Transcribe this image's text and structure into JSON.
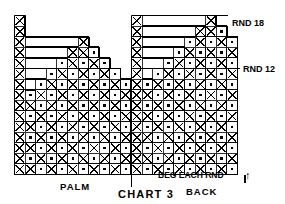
{
  "figure": {
    "title": "CHART 3",
    "type": "knitting-stitch-chart"
  },
  "labels": {
    "palm": "PALM",
    "back": "BACK",
    "chart_title": "CHART 3",
    "rnd18": "RND 18",
    "rnd12": "RND 12",
    "beg_each_rnd": "BEG EACH RND",
    "arrow": "↑"
  },
  "legend_symbols": {
    "cross": "X",
    "dot": "·",
    "blank": ""
  },
  "colors": {
    "ink": "#000000",
    "paper": "#ffffff",
    "grid": "#333333"
  },
  "chart_data": {
    "type": "heatmap",
    "title": "CHART 3",
    "xlabel": "",
    "ylabel": "",
    "grid": true,
    "legend_position": "none",
    "cell_size": 10.6,
    "rows": 15,
    "cols": 21,
    "symbol_key": {
      "X": "cross stitch (pattern colour)",
      ".": "dot stitch (background colour)",
      " ": "no stitch / outside shaping"
    },
    "annotations": [
      {
        "text": "RND 18",
        "x": 232,
        "y": 26
      },
      {
        "text": "RND 12",
        "x": 243,
        "y": 72
      },
      {
        "text": "BEG EACH RND",
        "x": 158,
        "y": 178
      },
      {
        "text": "PALM",
        "x": 60,
        "y": 188
      },
      {
        "text": "BACK",
        "x": 188,
        "y": 196
      },
      {
        "text": "CHART 3",
        "x": 122,
        "y": 197
      }
    ],
    "palm_panel": {
      "name": "PALM",
      "cols": 11,
      "rows": 15,
      "grid": [
        "X          ",
        "X          ",
        "X     X    ",
        "X    XX.   ",
        "X   .X.X.  ",
        "X  .X.X.X. ",
        "X .X.X.X.X.",
        "X.X.X.X.X.X",
        "XX.X.X.X.X.",
        "X.X.X.X.X.X",
        "XX.X.X.X.X.",
        "X.X.X.X.X.X",
        "XX.X.X.X.X.",
        "X.X.X.X.X.X",
        "XX.X.X.X.X."
      ]
    },
    "back_panel": {
      "name": "BACK",
      "cols": 10,
      "rows": 15,
      "grid": [
        "X      X  ",
        "X     XX. ",
        "X    .X.X.",
        "X   .X.X.X",
        "X  .X.X.X.",
        "X .X.X.X.X",
        "X.X.X.X.X.",
        "XX.X.X.X.X",
        "X.X.X.X.X.",
        "XX.X.X.X.X",
        "X.X.X.X.X.",
        "XX.X.X.X.X",
        "X.X.X.X.X.",
        "XX.X.X.X.X",
        "X.X.X.X.X."
      ]
    },
    "silhouette": {
      "description": "Two stepped pyramid panels separated by a solid cross-stitch column; left column of cross stitches on both outer edges",
      "palm_steps": [
        1,
        1,
        3,
        5,
        7,
        9,
        11,
        11,
        11,
        11,
        11,
        11,
        11,
        11,
        11
      ],
      "back_steps": [
        2,
        3,
        5,
        6,
        8,
        9,
        10,
        10,
        10,
        10,
        10,
        10,
        10,
        10,
        10
      ]
    }
  }
}
